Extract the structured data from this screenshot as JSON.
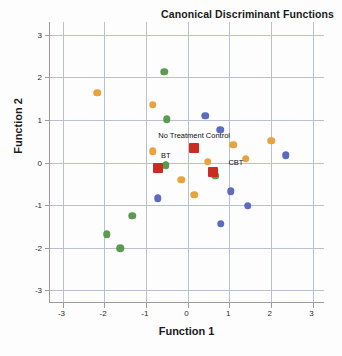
{
  "chart_data": {
    "type": "scatter",
    "title": "Canonical Discriminant Functions",
    "xlabel": "Function 1",
    "ylabel": "Function 2",
    "xlim": [
      -3.3,
      3.3
    ],
    "ylim": [
      -3.3,
      3.3
    ],
    "xticks": [
      "-3",
      "-2",
      "-1",
      "0",
      "1",
      "2",
      "3"
    ],
    "xtick_values": [
      -3,
      -2,
      -1,
      0,
      1,
      2,
      3
    ],
    "yticks": [
      "-3",
      "-2",
      "-1",
      "0",
      "1",
      "2",
      "3"
    ],
    "ytick_values": [
      -3,
      -2,
      -1,
      0,
      1,
      2,
      3
    ],
    "grid": true,
    "legend_position": "none",
    "colors": {
      "group_green": "#5B9B4F",
      "group_orange": "#E8A33D",
      "group_blue": "#5B6BBF",
      "centroid_red": "#CC2B1F",
      "gridline": "#b9bfd4",
      "axis": "#9b9b9b",
      "text": "#1b1b1b"
    },
    "series": [
      {
        "name": "BT",
        "marker": "circle",
        "color": "#5B9B4F",
        "points": [
          {
            "x": -0.56,
            "y": 2.13
          },
          {
            "x": -0.5,
            "y": 1.02
          },
          {
            "x": -0.52,
            "y": -0.06
          },
          {
            "x": 0.66,
            "y": -0.31
          },
          {
            "x": -1.33,
            "y": -1.25
          },
          {
            "x": -1.94,
            "y": -1.68
          },
          {
            "x": -1.62,
            "y": -2.01
          }
        ]
      },
      {
        "name": "CBT",
        "marker": "circle",
        "color": "#E8A33D",
        "points": [
          {
            "x": -2.17,
            "y": 1.64
          },
          {
            "x": -0.84,
            "y": 1.36
          },
          {
            "x": -0.83,
            "y": 0.26
          },
          {
            "x": 0.48,
            "y": 0.02
          },
          {
            "x": 1.1,
            "y": 0.42
          },
          {
            "x": 1.4,
            "y": 0.09
          },
          {
            "x": 2.01,
            "y": 0.51
          },
          {
            "x": -0.15,
            "y": -0.41
          },
          {
            "x": 0.16,
            "y": -0.76
          }
        ]
      },
      {
        "name": "No Treatment Control",
        "marker": "circle",
        "color": "#5B6BBF",
        "points": [
          {
            "x": 0.43,
            "y": 1.1
          },
          {
            "x": 0.78,
            "y": 0.77
          },
          {
            "x": 2.36,
            "y": 0.17
          },
          {
            "x": -0.71,
            "y": -0.84
          },
          {
            "x": 1.04,
            "y": -0.67
          },
          {
            "x": 1.45,
            "y": -1.01
          },
          {
            "x": 0.8,
            "y": -1.44
          }
        ]
      }
    ],
    "centroids": [
      {
        "label": "No Treatment Control",
        "x": 0.16,
        "y": 0.35,
        "color": "#CC2B1F",
        "marker": "square",
        "label_dx": 0,
        "label_dy": -13
      },
      {
        "label": "BT",
        "x": -0.71,
        "y": -0.12,
        "color": "#CC2B1F",
        "marker": "square",
        "label_dx": 8,
        "label_dy": -13
      },
      {
        "label": "CBT",
        "x": 0.61,
        "y": -0.22,
        "color": "#CC2B1F",
        "marker": "square",
        "label_dx": 23,
        "label_dy": -10
      }
    ]
  }
}
